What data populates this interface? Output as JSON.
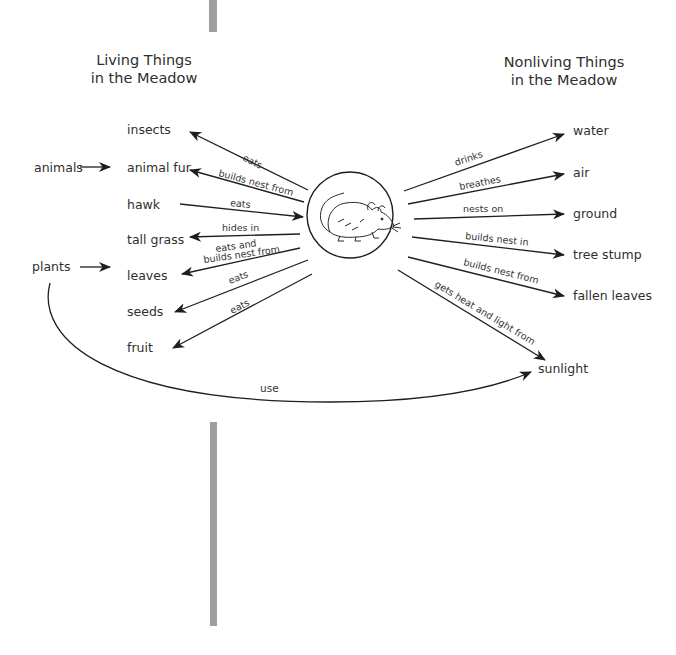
{
  "headings": {
    "living": [
      "Living Things",
      "in the Meadow"
    ],
    "nonliving": [
      "Nonliving Things",
      "in the Meadow"
    ]
  },
  "center": {
    "subject": "mouse",
    "icon": "mouse-icon"
  },
  "categories": {
    "animals": "animals",
    "plants": "plants"
  },
  "living_items": [
    {
      "name": "insects",
      "relation": "eats",
      "direction": "to-item"
    },
    {
      "name": "animal fur",
      "relation": "builds nest from",
      "direction": "to-item"
    },
    {
      "name": "hawk",
      "relation": "eats",
      "direction": "to-mouse"
    },
    {
      "name": "tall grass",
      "relation": "hides in",
      "direction": "to-item"
    },
    {
      "name": "leaves",
      "relation": [
        "eats and",
        "builds nest from"
      ],
      "direction": "to-item"
    },
    {
      "name": "seeds",
      "relation": "eats",
      "direction": "to-item"
    },
    {
      "name": "fruit",
      "relation": "eats",
      "direction": "to-item"
    }
  ],
  "nonliving_items": [
    {
      "name": "water",
      "relation": "drinks"
    },
    {
      "name": "air",
      "relation": "breathes"
    },
    {
      "name": "ground",
      "relation": "nests on"
    },
    {
      "name": "tree stump",
      "relation": "builds nest in"
    },
    {
      "name": "fallen leaves",
      "relation": "builds nest from"
    },
    {
      "name": "sunlight",
      "relation": "gets heat and light from"
    }
  ],
  "plants_to_sunlight": {
    "relation": "use"
  },
  "colors": {
    "line": "#1e1e1e",
    "text": "#2f2f2f",
    "bar": "#9e9e9e"
  }
}
